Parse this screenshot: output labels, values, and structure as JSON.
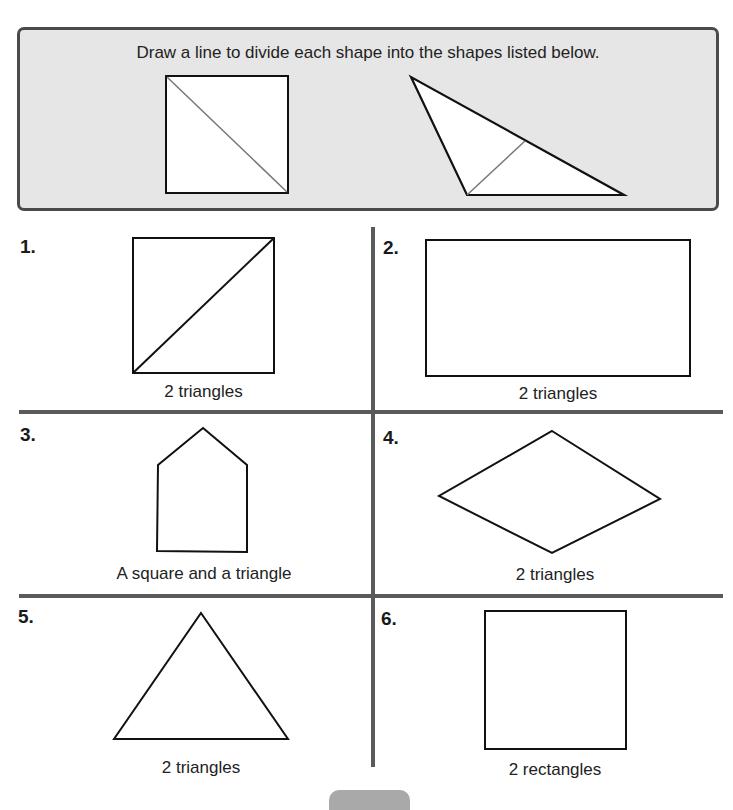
{
  "instruction": "Draw a line to divide each shape into the shapes listed below.",
  "examples": [
    {
      "shape": "rectangle",
      "divided_by": "diagonal line (top-left to bottom-right)"
    },
    {
      "shape": "triangle",
      "divided_by": "line from bottom-left vertex to long side"
    }
  ],
  "problems": [
    {
      "number": "1.",
      "shape": "square",
      "caption": "2 triangles",
      "answered": true
    },
    {
      "number": "2.",
      "shape": "rectangle",
      "caption": "2 triangles",
      "answered": false
    },
    {
      "number": "3.",
      "shape": "pentagon",
      "caption": "A square and a triangle",
      "answered": false
    },
    {
      "number": "4.",
      "shape": "rhombus",
      "caption": "2 triangles",
      "answered": false
    },
    {
      "number": "5.",
      "shape": "triangle",
      "caption": "2 triangles",
      "answered": false
    },
    {
      "number": "6.",
      "shape": "square",
      "caption": "2 rectangles",
      "answered": false
    }
  ],
  "colors": {
    "box_fill": "#e6e6e6",
    "box_border": "#4a4a4a",
    "grid_lines": "#5a5a5a",
    "shape_stroke": "#111111",
    "example_divider": "#777777"
  }
}
